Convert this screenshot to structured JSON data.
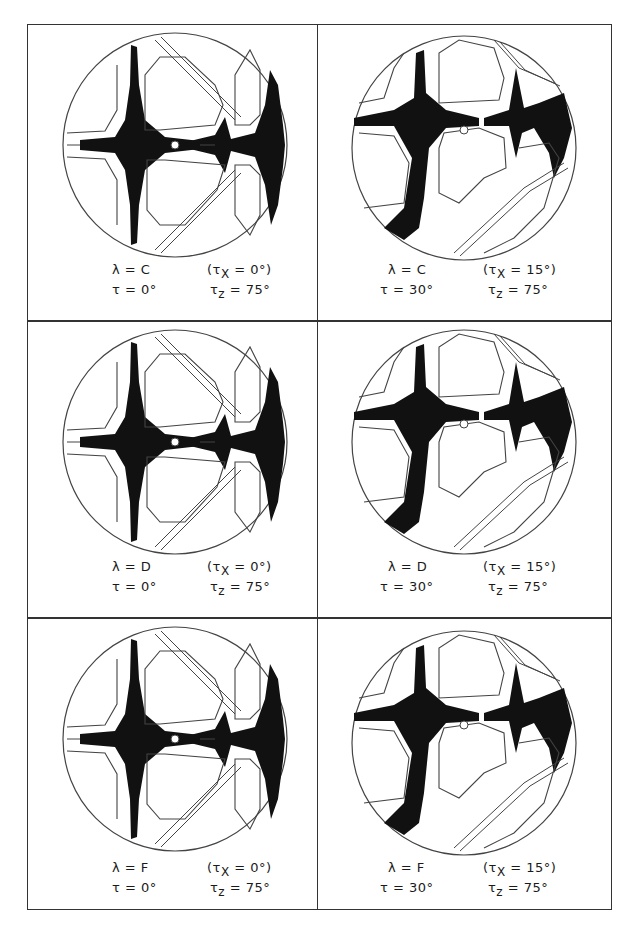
{
  "figure": {
    "panels": [
      {
        "id": "c0",
        "row": 0,
        "col": 0,
        "lambda": "λ = C",
        "tau": "τ = 0°",
        "taux_open": "(τ",
        "taux_sub": "X",
        "taux_val": " = 0°)",
        "tauz_pre": "τ",
        "tauz_sub": "z",
        "tauz_val": " = 75°"
      },
      {
        "id": "c15",
        "row": 0,
        "col": 1,
        "lambda": "λ = C",
        "tau": "τ = 30°",
        "taux_open": "(τ",
        "taux_sub": "X",
        "taux_val": " = 15°)",
        "tauz_pre": "τ",
        "tauz_sub": "z",
        "tauz_val": " = 75°"
      },
      {
        "id": "d0",
        "row": 1,
        "col": 0,
        "lambda": "λ = D",
        "tau": "τ = 0°",
        "taux_open": "(τ",
        "taux_sub": "X",
        "taux_val": " = 0°)",
        "tauz_pre": "τ",
        "tauz_sub": "z",
        "tauz_val": " = 75°"
      },
      {
        "id": "d15",
        "row": 1,
        "col": 1,
        "lambda": "λ = D",
        "tau": "τ = 30°",
        "taux_open": "(τ",
        "taux_sub": "X",
        "taux_val": " = 15°)",
        "tauz_pre": "τ",
        "tauz_sub": "z",
        "tauz_val": " = 75°"
      },
      {
        "id": "f0",
        "row": 2,
        "col": 0,
        "lambda": "λ = F",
        "tau": "τ = 0°",
        "taux_open": "(τ",
        "taux_sub": "X",
        "taux_val": " = 0°)",
        "tauz_pre": "τ",
        "tauz_sub": "z",
        "tauz_val": " = 75°"
      },
      {
        "id": "f15",
        "row": 2,
        "col": 1,
        "lambda": "λ = F",
        "tau": "τ = 30°",
        "taux_open": "(τ",
        "taux_sub": "X",
        "taux_val": " = 15°)",
        "tauz_pre": "τ",
        "tauz_sub": "z",
        "tauz_val": " = 75°"
      }
    ]
  },
  "colors": {
    "ink": "#111111",
    "line": "#444444",
    "paper": "#ffffff"
  }
}
